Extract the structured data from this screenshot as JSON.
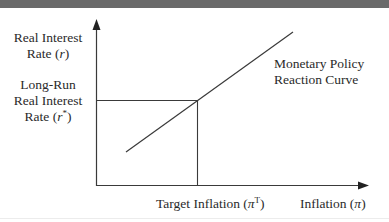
{
  "diagram": {
    "type": "economics-graph",
    "y_axis": {
      "label_line1": "Real Interest",
      "label_line2_prefix": "Rate (",
      "label_symbol": "r",
      "label_line2_suffix": ")"
    },
    "y_reference": {
      "label_line1": "Long-Run",
      "label_line2": "Real Interest",
      "label_line3_prefix": "Rate (",
      "label_symbol": "r",
      "label_superscript": "*",
      "label_line3_suffix": ")"
    },
    "x_axis": {
      "label_prefix": "Inflation (",
      "label_symbol": "π",
      "label_suffix": ")"
    },
    "x_reference": {
      "label_prefix": "Target Inflation (",
      "label_symbol": "π",
      "label_superscript": "T",
      "label_suffix": ")"
    },
    "curve": {
      "label_line1": "Monetary Policy",
      "label_line2": "Reaction Curve",
      "shape": "upward-sloping straight line"
    },
    "colors": {
      "line": "#3a3a3a",
      "text": "#2a2a2a",
      "top_bar": "#6a6a6a"
    }
  }
}
